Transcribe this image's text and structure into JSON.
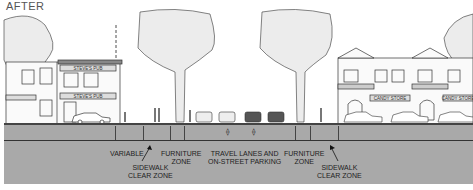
{
  "title": "AFTER",
  "diagram": {
    "type": "street-cross-section",
    "ground_color": "#a9a9a9",
    "left_building_signs": [
      "STEVE'S PUB",
      "STEVE'S PUB"
    ],
    "right_building_signs": [
      "CANDY STORE",
      "CANDY STORE"
    ],
    "labels": {
      "variable": "VARIABLE",
      "sidewalk_clear_left_1": "SIDEWALK",
      "sidewalk_clear_left_2": "CLEAR ZONE",
      "furniture_left_1": "FURNITURE",
      "furniture_left_2": "ZONE",
      "travel_1": "TRAVEL LANES AND",
      "travel_2": "ON-STREET PARKING",
      "furniture_right_1": "FURNITURE",
      "furniture_right_2": "ZONE",
      "sidewalk_clear_right_1": "SIDEWALK",
      "sidewalk_clear_right_2": "CLEAR ZONE"
    }
  }
}
